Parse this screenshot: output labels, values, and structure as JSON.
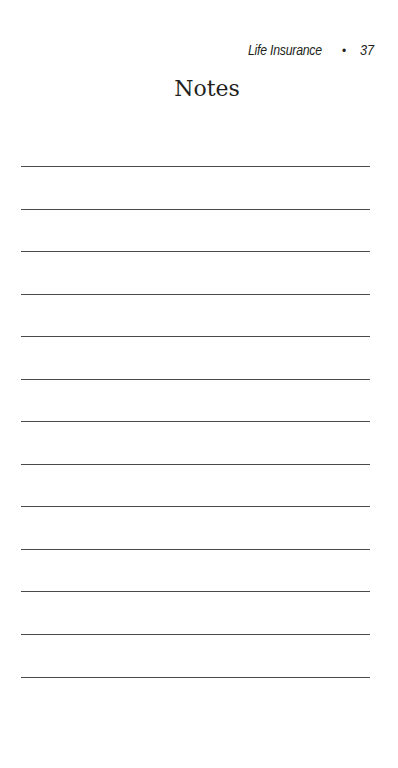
{
  "running_head": {
    "title": "Life Insurance",
    "separator": "•",
    "page_number": "37"
  },
  "page_title": "Notes",
  "note_lines": {
    "count": 13,
    "line_positions_y": [
      166,
      209,
      251,
      294,
      336,
      379,
      421,
      464,
      506,
      549,
      591,
      634,
      677
    ]
  }
}
